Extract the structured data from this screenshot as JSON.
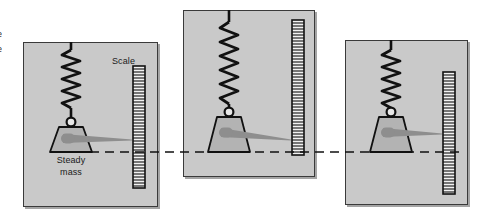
{
  "figure": {
    "background_color": "#ffffff",
    "panel_fill": "#c9c9c9",
    "panel_stroke": "#3a3a3a",
    "ink_color": "#111111",
    "mass_fill": "#b0b0b0",
    "pointer_color": "#8e8e8e",
    "scale_fill": "#f2f2f2"
  },
  "labels": {
    "scale": "Scale",
    "steady_mass_line1": "Steady",
    "steady_mass_line2": "mass",
    "edge_fragment_top": "e",
    "edge_fragment_bottom": "e"
  },
  "panels": [
    {
      "id": "panel-left",
      "name": "ground-frame-left",
      "x": 23,
      "y": 42,
      "width": 135,
      "height": 165,
      "spring_top_y": 42,
      "ring_y": 122,
      "mass_baseline_y": 152,
      "scale_x": 133,
      "scale_top_y": 66,
      "scale_height": 122,
      "scale_ticks": 40
    },
    {
      "id": "panel-middle",
      "name": "ground-frame-middle",
      "x": 183,
      "y": 10,
      "width": 132,
      "height": 167,
      "spring_top_y": 10,
      "ring_y": 112,
      "mass_baseline_y": 152,
      "scale_x": 292,
      "scale_top_y": 20,
      "scale_height": 135,
      "scale_ticks": 44
    },
    {
      "id": "panel-right",
      "name": "ground-frame-right",
      "x": 345,
      "y": 40,
      "width": 123,
      "height": 165,
      "spring_top_y": 40,
      "ring_y": 112,
      "mass_baseline_y": 152,
      "scale_x": 443,
      "scale_top_y": 72,
      "scale_height": 122,
      "scale_ticks": 40
    }
  ],
  "reference_line": {
    "name": "steady-mass-reference-line",
    "y": 152,
    "x_start": 90,
    "x_end": 462,
    "style": "dashed",
    "color": "#111111"
  }
}
